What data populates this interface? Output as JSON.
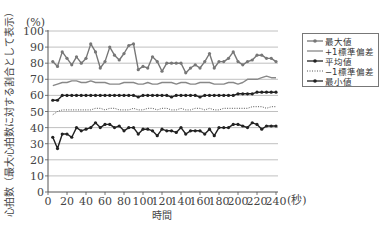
{
  "chart_data": {
    "type": "line",
    "title": "",
    "xlabel": "時間",
    "x_unit": "(秒)",
    "ylabel": "心拍数（最大心拍数に対する割合として表示）",
    "y_unit": "(%)",
    "xlim": [
      0,
      240
    ],
    "ylim": [
      0,
      100
    ],
    "xticks": [
      0,
      20,
      40,
      60,
      80,
      100,
      120,
      140,
      160,
      180,
      200,
      220,
      240
    ],
    "yticks": [
      0,
      10,
      20,
      30,
      40,
      50,
      60,
      70,
      80,
      90,
      100
    ],
    "grid": "horizontal",
    "legend_position": "right",
    "x": [
      5,
      10,
      15,
      20,
      25,
      30,
      35,
      40,
      45,
      50,
      55,
      60,
      65,
      70,
      75,
      80,
      85,
      90,
      95,
      100,
      105,
      110,
      115,
      120,
      125,
      130,
      135,
      140,
      145,
      150,
      155,
      160,
      165,
      170,
      175,
      180,
      185,
      190,
      195,
      200,
      205,
      210,
      215,
      220,
      225,
      230,
      235,
      240
    ],
    "series": [
      {
        "name": "最大値",
        "style": "marker-line",
        "color": "#777777",
        "values": [
          81,
          78,
          87,
          83,
          79,
          84,
          80,
          83,
          92,
          87,
          77,
          81,
          90,
          85,
          82,
          86,
          91,
          92,
          76,
          78,
          77,
          84,
          81,
          75,
          80,
          80,
          80,
          80,
          74,
          77,
          79,
          77,
          81,
          86,
          77,
          81,
          81,
          83,
          87,
          81,
          79,
          81,
          82,
          85,
          85,
          83,
          83,
          81
        ]
      },
      {
        "name": "+1標準偏差",
        "style": "solid",
        "color": "#888888",
        "values": [
          66,
          67,
          68,
          68,
          69,
          69,
          68,
          68,
          69,
          68,
          68,
          68,
          67,
          67,
          67,
          68,
          68,
          68,
          67,
          67,
          68,
          67,
          67,
          68,
          68,
          68,
          67,
          68,
          68,
          67,
          67,
          68,
          68,
          68,
          67,
          67,
          67,
          68,
          68,
          67,
          68,
          70,
          70,
          70,
          71,
          72,
          71,
          71
        ]
      },
      {
        "name": "平均値",
        "style": "marker-line",
        "color": "#222222",
        "values": [
          57,
          57,
          60,
          60,
          60,
          60,
          60,
          60,
          60,
          60,
          60,
          60,
          60,
          60,
          60,
          60,
          60,
          60,
          59,
          60,
          60,
          60,
          60,
          60,
          60,
          59,
          60,
          60,
          60,
          60,
          60,
          59,
          60,
          60,
          60,
          60,
          60,
          60,
          60,
          61,
          61,
          61,
          61,
          62,
          62,
          62,
          62,
          62
        ]
      },
      {
        "name": "−1標準偏差",
        "style": "dotted",
        "color": "#555555",
        "values": [
          48,
          50,
          51,
          51,
          51,
          51,
          51,
          51,
          51,
          52,
          52,
          51,
          52,
          52,
          51,
          51,
          51,
          52,
          51,
          51,
          52,
          52,
          51,
          52,
          52,
          51,
          51,
          52,
          51,
          51,
          52,
          52,
          51,
          52,
          51,
          51,
          52,
          52,
          52,
          52,
          52,
          52,
          53,
          53,
          53,
          52,
          53,
          53
        ]
      },
      {
        "name": "最小値",
        "style": "marker-line",
        "color": "#222222",
        "values": [
          34,
          27,
          36,
          36,
          34,
          40,
          38,
          39,
          40,
          43,
          40,
          42,
          42,
          40,
          41,
          38,
          40,
          40,
          36,
          39,
          39,
          38,
          35,
          39,
          38,
          38,
          37,
          40,
          36,
          38,
          38,
          38,
          36,
          39,
          35,
          40,
          40,
          40,
          42,
          42,
          41,
          40,
          43,
          42,
          39,
          41,
          41,
          41
        ]
      }
    ]
  },
  "legend": {
    "items": [
      "最大値",
      "+1標準偏差",
      "平均値",
      "−1標準偏差",
      "最小値"
    ]
  }
}
